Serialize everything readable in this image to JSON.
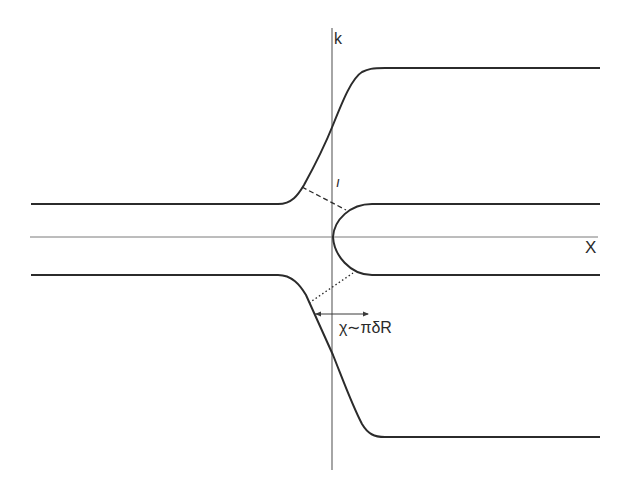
{
  "diagram": {
    "axes": {
      "vertical_label": "k",
      "horizontal_label": "X"
    },
    "annotation": {
      "arrow_label": "χ∼πδR",
      "tick_mark": "ı"
    },
    "colors": {
      "curve": "#2b2b2b",
      "axis": "#6a6a6a",
      "background": "#ffffff"
    }
  }
}
